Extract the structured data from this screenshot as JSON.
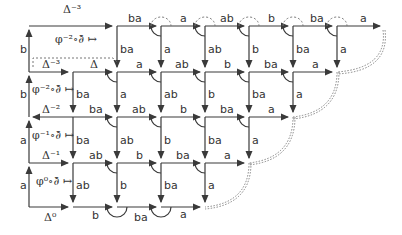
{
  "diagram": {
    "type": "commutative-grid",
    "colors": {
      "line": "#3a3a3a",
      "dotted": "#777777"
    },
    "left_column": {
      "rows": [
        {
          "side_label": "b",
          "top_label": "Δ⁻³",
          "cell_label": "φ⁻²∘∂̄ ↦"
        },
        {
          "side_label": "b",
          "top_label": "Δ⁻³",
          "cell_label": "φ⁻²∘∂̄ ↦"
        },
        {
          "side_label": "a",
          "top_label": "Δ⁻²",
          "cell_label": "φ⁻¹∘∂̄ ↦"
        },
        {
          "side_label": "a",
          "top_label": "Δ⁻¹",
          "cell_label": "φ⁰∘∂̄ ↦"
        }
      ],
      "bottom_label": "Δ⁰",
      "row2_second_label": "Δ"
    },
    "rows_horizontal": [
      [
        "ba",
        "a",
        "ab",
        "b",
        "ba",
        "a"
      ],
      [
        "a",
        "ab",
        "b",
        "ba",
        "a"
      ],
      [
        "ba",
        "ab",
        "b",
        "ba",
        "a"
      ],
      [
        "ab",
        "b",
        "ba",
        "a"
      ],
      [
        "b",
        "ba",
        "a"
      ]
    ],
    "rows_vertical": [
      [
        "ba",
        "a",
        "ab",
        "b",
        "ba",
        "a"
      ],
      [
        "ba",
        "a",
        "ab",
        "b",
        "ba",
        "a"
      ],
      [
        "ba",
        "ab",
        "b",
        "ba",
        "a"
      ],
      [
        "ab",
        "b",
        "ba",
        "a"
      ]
    ]
  }
}
